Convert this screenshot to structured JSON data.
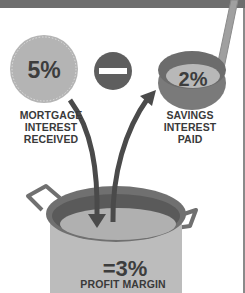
{
  "colors": {
    "band": "#6e6e6e",
    "circle_fill": "#b4b4b4",
    "circle_dots": "#dcdcdc",
    "minus_fill": "#5e5e5e",
    "ladle_rim": "#777777",
    "ladle_inner": "#b8b8b8",
    "arrow": "#4a4a4a",
    "pot_body": "#bcbcbc",
    "pot_outline": "#6a6a6a",
    "text": "#3a3a3a"
  },
  "mortgage": {
    "value": "5%",
    "label_lines": [
      "MORTGAGE",
      "INTEREST",
      "RECEIVED"
    ],
    "icon": "coin-circle-icon"
  },
  "operator": {
    "symbol": "minus",
    "icon": "minus-circle-icon"
  },
  "savings": {
    "value": "2%",
    "label_lines": [
      "SAVINGS",
      "INTEREST",
      "PAID"
    ],
    "icon": "ladle-icon"
  },
  "result": {
    "value": "=3%",
    "label": "PROFIT MARGIN",
    "icon": "pot-icon"
  },
  "arrows": [
    {
      "from": "mortgage",
      "to": "pot",
      "direction": "down"
    },
    {
      "from": "pot",
      "to": "savings",
      "direction": "up"
    }
  ]
}
